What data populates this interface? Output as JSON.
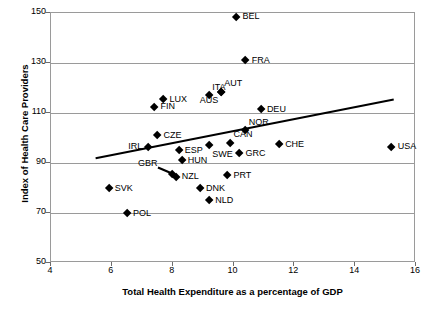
{
  "chart_data": {
    "type": "scatter",
    "title": "",
    "xlabel": "Total Health Expenditure as a percentage of GDP",
    "ylabel": "Index of Health Care Providers",
    "xlim": [
      4,
      16
    ],
    "ylim": [
      50,
      150
    ],
    "xticks": [
      "4",
      "6",
      "8",
      "10",
      "12",
      "14",
      "16"
    ],
    "yticks": [
      "150",
      "130",
      "110",
      "90",
      "70",
      "50"
    ],
    "grid": "horizontal",
    "legend": "none",
    "marker_color": "#000000",
    "gridline_color": "#9a9a9a",
    "points": [
      {
        "label": "BEL",
        "x": 10.1,
        "y": 148.5,
        "label_pos": "lab-r"
      },
      {
        "label": "FRA",
        "x": 10.4,
        "y": 131.0,
        "label_pos": "lab-r"
      },
      {
        "label": "AUT",
        "x": 9.6,
        "y": 118.5,
        "label_pos": "lab-tr"
      },
      {
        "label": "ITA",
        "x": 9.2,
        "y": 117.0,
        "label_pos": "lab-tr"
      },
      {
        "label": "AUS",
        "x": 9.6,
        "y": 118.5,
        "label_pos": "lab-bl"
      },
      {
        "label": "LUX",
        "x": 7.7,
        "y": 115.5,
        "label_pos": "lab-r"
      },
      {
        "label": "FIN",
        "x": 7.4,
        "y": 112.5,
        "label_pos": "lab-r"
      },
      {
        "label": "DEU",
        "x": 10.9,
        "y": 111.5,
        "label_pos": "lab-r"
      },
      {
        "label": "NOR",
        "x": 10.4,
        "y": 103.0,
        "label_pos": "lab-tr"
      },
      {
        "label": "CZE",
        "x": 7.5,
        "y": 101.0,
        "label_pos": "lab-r"
      },
      {
        "label": "CAN",
        "x": 9.9,
        "y": 98.0,
        "label_pos": "lab-tr"
      },
      {
        "label": "CHE",
        "x": 11.5,
        "y": 97.5,
        "label_pos": "lab-r"
      },
      {
        "label": "SWE",
        "x": 9.2,
        "y": 97.0,
        "label_pos": "lab-br"
      },
      {
        "label": "IRL",
        "x": 7.2,
        "y": 96.5,
        "label_pos": "lab-l"
      },
      {
        "label": "USA",
        "x": 15.2,
        "y": 96.5,
        "label_pos": "lab-r"
      },
      {
        "label": "ESP",
        "x": 8.2,
        "y": 95.0,
        "label_pos": "lab-r"
      },
      {
        "label": "GRC",
        "x": 10.2,
        "y": 94.0,
        "label_pos": "lab-r"
      },
      {
        "label": "HUN",
        "x": 8.3,
        "y": 91.0,
        "label_pos": "lab-r"
      },
      {
        "label": "PRT",
        "x": 9.8,
        "y": 85.0,
        "label_pos": "lab-r"
      },
      {
        "label": "NZL",
        "x": 8.1,
        "y": 84.5,
        "label_pos": "lab-r"
      },
      {
        "label": "GBR",
        "x": 8.0,
        "y": 85.5,
        "label_pos": "none"
      },
      {
        "label": "DNK",
        "x": 8.9,
        "y": 80.0,
        "label_pos": "lab-r"
      },
      {
        "label": "SVK",
        "x": 5.9,
        "y": 80.0,
        "label_pos": "lab-r"
      },
      {
        "label": "NLD",
        "x": 9.2,
        "y": 75.0,
        "label_pos": "lab-r"
      },
      {
        "label": "POL",
        "x": 6.5,
        "y": 70.0,
        "label_pos": "lab-r"
      }
    ],
    "annotations": [
      {
        "name": "gbr-leader",
        "text": "GBR",
        "points_to_x": 8.05,
        "points_to_y": 85.2,
        "text_x": 7.55,
        "text_y": 87.8
      }
    ],
    "trendline": {
      "type": "linear-fit",
      "x_start": 5.5,
      "y_start": 91.5,
      "x_end": 15.3,
      "y_end": 115.0,
      "color": "#000000"
    }
  }
}
